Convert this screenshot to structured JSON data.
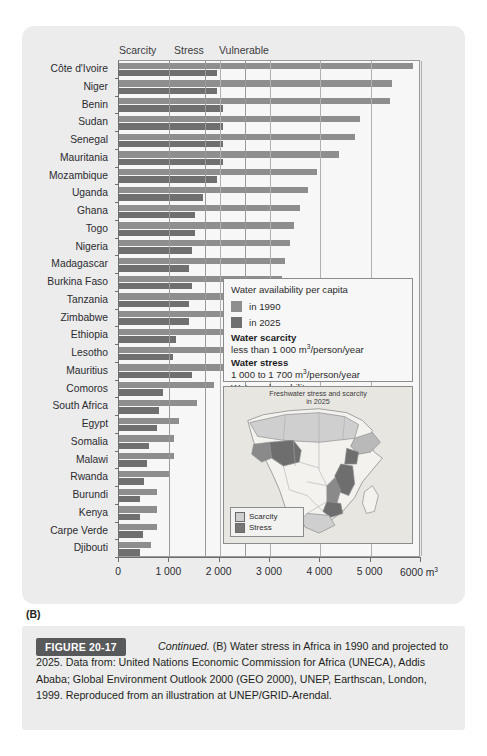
{
  "panel_label": "(B)",
  "column_headers": [
    "Scarcity",
    "Stress",
    "Vulnerable"
  ],
  "axis": {
    "unit": "6000 m",
    "unit_sup": "3",
    "ticks": [
      "0",
      "1 000",
      "2 000",
      "3 000",
      "4 000",
      "5 000",
      "6 000"
    ]
  },
  "legend": {
    "title": "Water availability per capita",
    "series_1990": "in 1990",
    "series_2025": "in 2025",
    "scarcity_head": "Water scarcity",
    "scarcity_sub_a": "less than 1 000 m",
    "scarcity_sub_b": "/person/year",
    "stress_head": "Water stress",
    "stress_sub_a": "1 000 to 1 700 m",
    "stress_sub_b": "/person/year",
    "vulnerability_head": "Water vulnerability",
    "vulnerability_sub_a": "1 700 to 2 500 m",
    "vulnerability_sub_b": "/person/year",
    "sup": "3",
    "color_1990": "#8e8e8e",
    "color_2025": "#6f6f6f"
  },
  "map": {
    "title_line1": "Freshwater stress and scarcity",
    "title_line2": "in 2025",
    "legend_scarcity": "Scarcity",
    "legend_stress": "Stress",
    "color_scarcity": "#cfcfcf",
    "color_stress": "#777777"
  },
  "caption": {
    "figure_number": "FIGURE 20-17",
    "continued": "Continued.",
    "body": " (B) Water stress in Africa in 1990 and projected to 2025. Data from: United Nations Economic Commission for Africa (UNECA), Addis Ababa; Global Environment Outlook 2000 (GEO 2000), UNEP, Earthscan, London, 1999. Reproduced from an illustration at UNEP/GRID-Arendal."
  },
  "chart_data": {
    "type": "bar",
    "title": "Water stress in Africa in 1990 and projected to 2025",
    "xlabel": "Water availability per capita (m3/person/year)",
    "ylabel": "",
    "xlim": [
      0,
      6000
    ],
    "grid": true,
    "orientation": "horizontal",
    "legend_position": "inside-right",
    "categories": [
      "Côte d'Ivoire",
      "Niger",
      "Benin",
      "Sudan",
      "Senegal",
      "Mauritania",
      "Mozambique",
      "Uganda",
      "Ghana",
      "Togo",
      "Nigeria",
      "Madagascar",
      "Burkina Faso",
      "Tanzania",
      "Zimbabwe",
      "Ethiopia",
      "Lesotho",
      "Mauritius",
      "Comoros",
      "South Africa",
      "Egypt",
      "Somalia",
      "Malawi",
      "Rwanda",
      "Burundi",
      "Kenya",
      "Carpe Verde",
      "Djibouti"
    ],
    "series": [
      {
        "name": "in 1990",
        "color": "#8e8e8e",
        "values": [
          5840,
          5430,
          5380,
          4790,
          4680,
          4370,
          3930,
          3760,
          3590,
          3480,
          3390,
          3290,
          3230,
          3190,
          2980,
          2380,
          2340,
          2310,
          1880,
          1540,
          1200,
          1100,
          1100,
          1000,
          760,
          760,
          760,
          640
        ]
      },
      {
        "name": "in 2025",
        "color": "#6f6f6f",
        "values": [
          1950,
          1950,
          2060,
          2060,
          2060,
          2060,
          1950,
          1660,
          1500,
          1500,
          1450,
          1400,
          1450,
          1400,
          1400,
          1140,
          1080,
          1450,
          870,
          790,
          760,
          590,
          560,
          500,
          420,
          420,
          480,
          420
        ]
      }
    ],
    "thresholds": {
      "scarcity": 1000,
      "stress": 1700,
      "vulnerable": 2500
    }
  }
}
